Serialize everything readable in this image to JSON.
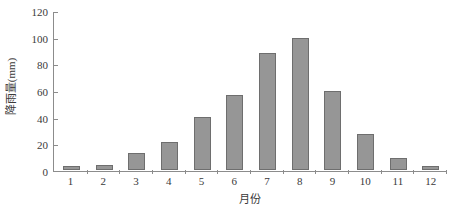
{
  "chart_data": {
    "type": "bar",
    "title": "",
    "subtitle": "",
    "xlabel": "月份",
    "ylabel": "降雨量(mm)",
    "categories": [
      "1",
      "2",
      "3",
      "4",
      "5",
      "6",
      "7",
      "8",
      "9",
      "10",
      "11",
      "12"
    ],
    "values": [
      3,
      4,
      13,
      21,
      40,
      56,
      88,
      99,
      59,
      27,
      9,
      3
    ],
    "series": [
      {
        "name": "降雨量",
        "values": [
          3,
          4,
          13,
          21,
          40,
          56,
          88,
          99,
          59,
          27,
          9,
          3
        ]
      }
    ],
    "ylim": [
      0,
      120
    ],
    "ytick_values": [
      0,
      20,
      40,
      60,
      80,
      100,
      120
    ],
    "ytick_labels": [
      "0",
      "20",
      "40",
      "60",
      "80",
      "100",
      "120"
    ],
    "grid": false,
    "legend": false,
    "legend_position": "none",
    "bar_color": "#969696",
    "bar_border_color": "#6e6e6e",
    "axis_color": "#8c8c8c",
    "text_color": "#3a3a3a",
    "background_color": "#ffffff"
  }
}
